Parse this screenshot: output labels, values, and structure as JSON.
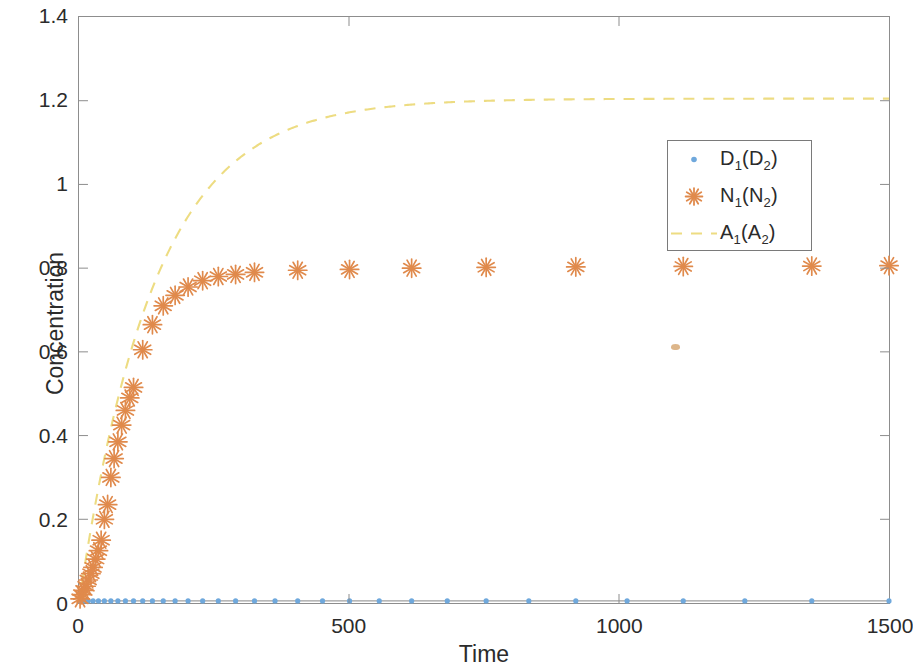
{
  "figure": {
    "background": "#ffffff",
    "frame_color": "#8d8d8d"
  },
  "axis_titles": {
    "x": "Time",
    "y": "Concentration"
  },
  "ticks": {
    "x": [
      "0",
      "500",
      "1000",
      "1500"
    ],
    "y": [
      "0",
      "0.2",
      "0.4",
      "0.6",
      "0.8",
      "1",
      "1.2",
      "1.4"
    ]
  },
  "legend": {
    "position": "upper-right",
    "entries": [
      {
        "label": "D",
        "sub1": "1",
        "mid": "(D",
        "sub2": "2",
        "tail": ")",
        "marker": "dot",
        "color": "#6FA8DC",
        "name": "legend-item-d"
      },
      {
        "label": "N",
        "sub1": "1",
        "mid": "(N",
        "sub2": "2",
        "tail": ")",
        "marker": "asterisk",
        "color": "#E08A4C",
        "name": "legend-item-n"
      },
      {
        "label": "A",
        "sub1": "1",
        "mid": "(A",
        "sub2": "2",
        "tail": ")",
        "marker": "dashed-line",
        "color": "#EDDC82",
        "name": "legend-item-a"
      }
    ]
  },
  "chart_data": {
    "type": "scatter",
    "title": "",
    "xlabel": "Time",
    "ylabel": "Concentration",
    "xlim": [
      0,
      1500
    ],
    "ylim": [
      0,
      1.4
    ],
    "xticks": [
      0,
      500,
      1000,
      1500
    ],
    "yticks": [
      0,
      0.2,
      0.4,
      0.6,
      0.8,
      1.0,
      1.2,
      1.4
    ],
    "grid": false,
    "legend_position": "upper right",
    "series": [
      {
        "name": "D_1(D_2)",
        "display": "D1(D2)",
        "marker": "dot",
        "linestyle": "none",
        "color": "#6FA8DC",
        "x": [
          2,
          9,
          17,
          26,
          36,
          47,
          59,
          72,
          86,
          101,
          118,
          136,
          156,
          178,
          202,
          229,
          258,
          290,
          325,
          363,
          405,
          451,
          501,
          556,
          616,
          682,
          754,
          833,
          920,
          1015,
          1119,
          1233,
          1357,
          1500
        ],
        "y": [
          0.004,
          0.005,
          0.005,
          0.005,
          0.005,
          0.005,
          0.005,
          0.005,
          0.005,
          0.005,
          0.005,
          0.005,
          0.005,
          0.005,
          0.005,
          0.005,
          0.005,
          0.005,
          0.005,
          0.005,
          0.005,
          0.005,
          0.005,
          0.005,
          0.005,
          0.005,
          0.005,
          0.005,
          0.005,
          0.005,
          0.005,
          0.005,
          0.005,
          0.005
        ]
      },
      {
        "name": "N_1(N_2)",
        "display": "N1(N2)",
        "marker": "asterisk",
        "linestyle": "none",
        "color": "#E08A4C",
        "x": [
          2,
          5,
          9,
          13,
          17,
          22,
          26,
          31,
          36,
          41,
          47,
          53,
          59,
          65,
          72,
          79,
          86,
          94,
          101,
          118,
          136,
          156,
          178,
          202,
          229,
          258,
          290,
          325,
          405,
          501,
          616,
          754,
          920,
          1119,
          1357,
          1500
        ],
        "y": [
          0.01,
          0.02,
          0.03,
          0.04,
          0.055,
          0.07,
          0.085,
          0.105,
          0.125,
          0.15,
          0.2,
          0.235,
          0.3,
          0.345,
          0.385,
          0.425,
          0.46,
          0.49,
          0.515,
          0.605,
          0.665,
          0.71,
          0.735,
          0.755,
          0.77,
          0.78,
          0.785,
          0.79,
          0.795,
          0.797,
          0.8,
          0.802,
          0.803,
          0.804,
          0.805,
          0.806
        ]
      },
      {
        "name": "A_1(A_2)",
        "display": "A1(A2)",
        "marker": "none",
        "linestyle": "dashed",
        "color": "#EDDC82",
        "plateau": 1.205,
        "rate": 0.0072,
        "x": [
          0,
          25,
          50,
          75,
          100,
          125,
          150,
          175,
          200,
          250,
          300,
          350,
          400,
          450,
          500,
          600,
          700,
          800,
          900,
          1000,
          1100,
          1200,
          1300,
          1400,
          1500
        ],
        "y": [
          0.0,
          0.199,
          0.363,
          0.5,
          0.614,
          0.709,
          0.788,
          0.853,
          0.908,
          0.992,
          1.049,
          1.088,
          1.115,
          1.133,
          1.146,
          1.164,
          1.175,
          1.185,
          1.192,
          1.197,
          1.2,
          1.202,
          1.203,
          1.204,
          1.205
        ]
      }
    ]
  }
}
